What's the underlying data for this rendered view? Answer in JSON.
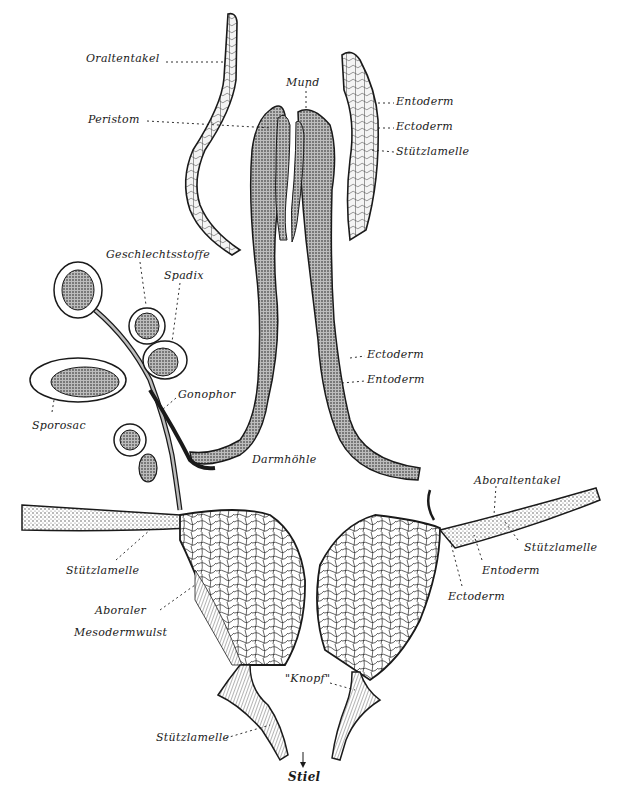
{
  "figure": {
    "colors": {
      "ink": "#1a1a1a",
      "stipple": "#6b6b6b",
      "background": "#ffffff"
    },
    "labels": [
      {
        "id": "oraltentakel",
        "text": "Oraltentakel",
        "x": 86,
        "y": 57
      },
      {
        "id": "mund",
        "text": "Mund",
        "x": 286,
        "y": 80
      },
      {
        "id": "peristom",
        "text": "Peristom",
        "x": 88,
        "y": 117
      },
      {
        "id": "entoderm-top",
        "text": "Entoderm",
        "x": 396,
        "y": 99
      },
      {
        "id": "ectoderm-top",
        "text": "Ectoderm",
        "x": 396,
        "y": 124
      },
      {
        "id": "stuetzlamelle-top",
        "text": "Stützlamelle",
        "x": 396,
        "y": 149
      },
      {
        "id": "geschlechtsstoffe",
        "text": "Geschlechtsstoffe",
        "x": 106,
        "y": 252
      },
      {
        "id": "spadix",
        "text": "Spadix",
        "x": 164,
        "y": 273
      },
      {
        "id": "ectoderm-mid",
        "text": "Ectoderm",
        "x": 367,
        "y": 352
      },
      {
        "id": "entoderm-mid",
        "text": "Entoderm",
        "x": 367,
        "y": 377
      },
      {
        "id": "gonophor",
        "text": "Gonophor",
        "x": 178,
        "y": 392
      },
      {
        "id": "sporosac",
        "text": "Sporosac",
        "x": 32,
        "y": 423
      },
      {
        "id": "darmhoehle",
        "text": "Darmhöhle",
        "x": 252,
        "y": 457
      },
      {
        "id": "aboraltentakel",
        "text": "Aboraltentakel",
        "x": 474,
        "y": 478
      },
      {
        "id": "stuetzlamelle-right",
        "text": "Stützlamelle",
        "x": 524,
        "y": 545
      },
      {
        "id": "entoderm-bottom",
        "text": "Entoderm",
        "x": 482,
        "y": 568
      },
      {
        "id": "stuetzlamelle-left",
        "text": "Stützlamelle",
        "x": 66,
        "y": 568
      },
      {
        "id": "ectoderm-bottom",
        "text": "Ectoderm",
        "x": 448,
        "y": 594
      },
      {
        "id": "aboraler",
        "text": "Aboraler",
        "x": 95,
        "y": 608
      },
      {
        "id": "mesodermwulst",
        "text": "Mesodermwulst",
        "x": 74,
        "y": 630
      },
      {
        "id": "knopf",
        "text": "\"Knopf\"",
        "x": 285,
        "y": 676
      },
      {
        "id": "stuetzlamelle-stalk",
        "text": "Stützlamelle",
        "x": 156,
        "y": 735
      },
      {
        "id": "stiel",
        "text": "Stiel",
        "x": 288,
        "y": 773
      }
    ],
    "stalk_arrow": "↓"
  }
}
